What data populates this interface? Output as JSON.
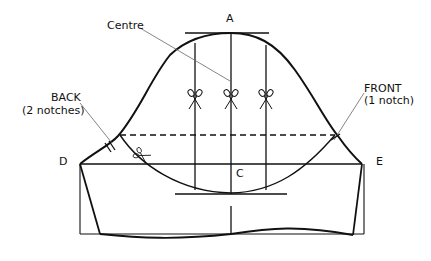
{
  "diagram": {
    "type": "sleeve pattern draft",
    "labels": {
      "top_point": "A",
      "centre": "Centre",
      "back_title": "BACK",
      "back_sub": "(2 notches)",
      "front_title": "FRONT",
      "front_sub": "(1 notch)",
      "left_point": "D",
      "right_point": "E",
      "bottom_point": "C"
    },
    "icons": [
      "scissors-icon",
      "scissors-icon",
      "scissors-icon",
      "scissors-icon"
    ],
    "colors": {
      "line": "#111111",
      "leader": "#666666",
      "background": "#ffffff"
    }
  }
}
